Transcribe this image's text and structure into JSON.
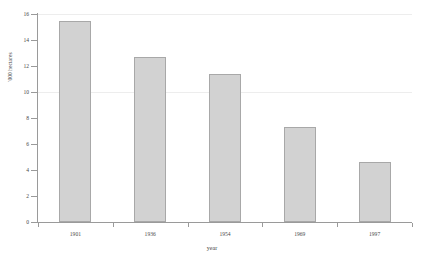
{
  "chart_data": {
    "type": "bar",
    "title": "",
    "subtitle": "",
    "xlabel": "year",
    "ylabel": "'000 hectares",
    "categories": [
      "1901",
      "1936",
      "1954",
      "1969",
      "1997"
    ],
    "values": [
      15.5,
      12.7,
      11.4,
      7.3,
      4.6
    ],
    "ylim": [
      0,
      16
    ],
    "y_ticks": [
      "0",
      "2",
      "4",
      "6",
      "8",
      "10",
      "12",
      "14",
      "16"
    ],
    "y_tick_values": [
      0,
      2,
      4,
      6,
      8,
      10,
      12,
      14,
      16
    ],
    "grid": "faint-horizontal",
    "legend": "none",
    "bar_color": "#d2d2d2",
    "bar_border_color": "#a8a8a8",
    "axis_color": "#9a9a9a",
    "gridline_color": "#ededed",
    "background": "#ffffff"
  }
}
